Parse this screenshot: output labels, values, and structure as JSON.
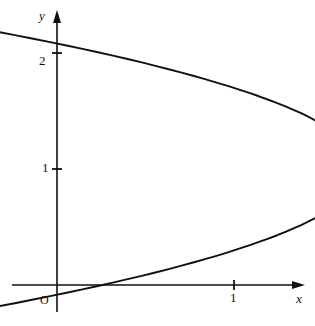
{
  "figure": {
    "name": "parabola-graph",
    "background_color": "#ffffff",
    "stroke_color": "#111111",
    "width": 315,
    "height": 326
  },
  "axes": {
    "x_label": "x",
    "y_label": "y",
    "origin_label": "O",
    "x_ticks": [
      {
        "value": 1,
        "label": "1"
      }
    ],
    "y_ticks": [
      {
        "value": 1,
        "label": "1"
      },
      {
        "value": 2,
        "label": "2"
      }
    ]
  },
  "chart_data": {
    "type": "line",
    "title": "",
    "subtitle": "",
    "xlabel": "x",
    "ylabel": "y",
    "xlim": [
      -0.27,
      1.46
    ],
    "ylim": [
      -0.23,
      2.35
    ],
    "grid": false,
    "legend": null,
    "annotations": [],
    "series": [
      {
        "name": "x = y(2 - y)",
        "equation": "x = y(2 - y)",
        "orientation": "opens-left",
        "vertex": [
          1,
          1
        ],
        "x_intercepts": [
          0
        ],
        "y_intercepts": [
          0,
          2
        ],
        "parameter": "y",
        "param_range": [
          -0.24,
          2.24
        ],
        "x": [
          -0.538,
          -0.433,
          -0.331,
          -0.231,
          -0.134,
          -0.039,
          0.054,
          0.144,
          0.231,
          0.316,
          0.399,
          0.479,
          0.556,
          0.631,
          0.704,
          0.774,
          0.841,
          0.906,
          0.969,
          1.029,
          1.086,
          1.141,
          1.194,
          1.244,
          1.291,
          1.336,
          1.379,
          1.419,
          1.456,
          1.491,
          1.524,
          1.554,
          1.581,
          1.606,
          1.629,
          1.649,
          1.666,
          1.681,
          1.694,
          1.704,
          1.711,
          1.716,
          1.719,
          1.719,
          1.716,
          1.711,
          1.704,
          1.694,
          1.681,
          1.666,
          1.649,
          1.629,
          1.606,
          1.581,
          1.554,
          1.524,
          1.491,
          1.456,
          1.419,
          1.379,
          1.336,
          1.291,
          1.244,
          1.194,
          1.141,
          1.086,
          1.029,
          0.969,
          0.906,
          0.841,
          0.774,
          0.704,
          0.631,
          0.556,
          0.479,
          0.399,
          0.316,
          0.231,
          0.144,
          0.054,
          -0.039,
          -0.134,
          -0.231,
          -0.331,
          -0.433,
          -0.538
        ],
        "y": [
          2.24,
          2.211,
          2.181,
          2.152,
          2.123,
          2.094,
          2.065,
          2.035,
          2.006,
          1.977,
          1.948,
          1.919,
          1.889,
          1.86,
          1.831,
          1.802,
          1.773,
          1.743,
          1.714,
          1.685,
          1.656,
          1.627,
          1.597,
          1.568,
          1.539,
          1.51,
          1.481,
          1.451,
          1.422,
          1.393,
          1.364,
          1.335,
          1.305,
          1.276,
          1.247,
          1.218,
          1.189,
          1.159,
          1.13,
          1.101,
          1.072,
          1.043,
          1.013,
          0.984,
          0.955,
          0.926,
          0.897,
          0.867,
          0.838,
          0.809,
          0.78,
          0.751,
          0.721,
          0.692,
          0.663,
          0.634,
          0.605,
          0.575,
          0.546,
          0.517,
          0.488,
          0.459,
          0.429,
          0.4,
          0.371,
          0.342,
          0.313,
          0.283,
          0.254,
          0.225,
          0.196,
          0.167,
          0.137,
          0.108,
          0.079,
          0.05,
          0.021,
          -0.009,
          -0.038,
          -0.067,
          -0.096,
          -0.125,
          -0.155,
          -0.184,
          -0.213,
          -0.242
        ]
      }
    ]
  }
}
